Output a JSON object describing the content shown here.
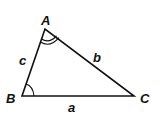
{
  "diagram": {
    "type": "triangle",
    "vertices": [
      {
        "name": "A",
        "label": "A",
        "x": 45,
        "y": 29,
        "label_x": 41,
        "label_y": 25
      },
      {
        "name": "B",
        "label": "B",
        "x": 22,
        "y": 96,
        "label_x": 6,
        "label_y": 103
      },
      {
        "name": "C",
        "label": "C",
        "x": 134,
        "y": 96,
        "label_x": 140,
        "label_y": 103
      }
    ],
    "sides": [
      {
        "name": "a",
        "label": "a",
        "from": "B",
        "to": "C",
        "label_x": 68,
        "label_y": 112
      },
      {
        "name": "b",
        "label": "b",
        "from": "A",
        "to": "C",
        "label_x": 93,
        "label_y": 62
      },
      {
        "name": "c",
        "label": "c",
        "from": "A",
        "to": "B",
        "label_x": 19,
        "label_y": 65
      }
    ],
    "angle_marks": [
      {
        "vertex": "A",
        "arcs": 2
      },
      {
        "vertex": "B",
        "arcs": 1
      }
    ]
  }
}
